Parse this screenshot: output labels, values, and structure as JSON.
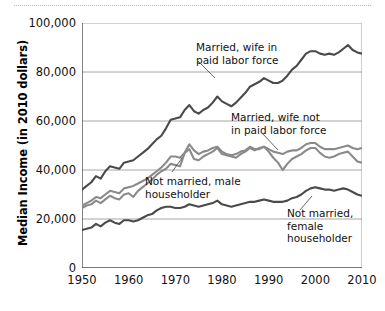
{
  "chart_data": {
    "type": "line",
    "title": "",
    "xlabel": "",
    "ylabel": "Median Income (in 2010 dollars)",
    "xlim": [
      1950,
      2010
    ],
    "ylim": [
      0,
      100000
    ],
    "grid": true,
    "legend_position": "inline-annotations",
    "ytick_labels": [
      "100,000",
      "80,000",
      "60,000",
      "40,000",
      "20,000",
      "0"
    ],
    "ytick_values": [
      100000,
      80000,
      60000,
      40000,
      20000,
      0
    ],
    "xtick_labels": [
      "1950",
      "1960",
      "1970",
      "1980",
      "1990",
      "2000",
      "2010"
    ],
    "xtick_values": [
      1950,
      1960,
      1970,
      1980,
      1990,
      2000,
      2010
    ],
    "x": [
      1950,
      1951,
      1952,
      1953,
      1954,
      1955,
      1956,
      1957,
      1958,
      1959,
      1960,
      1961,
      1962,
      1963,
      1964,
      1965,
      1966,
      1967,
      1968,
      1969,
      1970,
      1971,
      1972,
      1973,
      1974,
      1975,
      1976,
      1977,
      1978,
      1979,
      1980,
      1981,
      1982,
      1983,
      1984,
      1985,
      1986,
      1987,
      1988,
      1989,
      1990,
      1991,
      1992,
      1993,
      1994,
      1995,
      1996,
      1997,
      1998,
      1999,
      2000,
      2001,
      2002,
      2003,
      2004,
      2005,
      2006,
      2007,
      2008,
      2009,
      2010
    ],
    "series": [
      {
        "name": "Married, wife in paid labor force",
        "color": "#4a4a4a",
        "annotation": "Married, wife in\npaid labor force",
        "values": [
          32000,
          33500,
          35000,
          37500,
          36500,
          39500,
          41500,
          41000,
          40500,
          43000,
          43500,
          44000,
          45500,
          47000,
          48500,
          50500,
          52500,
          54000,
          57000,
          60500,
          61000,
          61500,
          64500,
          66500,
          64000,
          63000,
          64500,
          65500,
          67500,
          70000,
          68000,
          67000,
          66000,
          67500,
          69500,
          71500,
          74000,
          75000,
          76000,
          77500,
          76500,
          75500,
          75500,
          76500,
          78500,
          81000,
          82500,
          85000,
          87500,
          88500,
          88500,
          87500,
          87000,
          87500,
          87000,
          88000,
          89500,
          91000,
          89000,
          88000,
          87500
        ]
      },
      {
        "name": "Married, wife not in paid labor force",
        "color": "#8a8a8a",
        "annotation": "Married, wife not\nin paid labor force",
        "values": [
          25500,
          26500,
          27500,
          29000,
          28500,
          30000,
          31500,
          31000,
          30500,
          32500,
          33000,
          33500,
          34500,
          35500,
          36500,
          38000,
          39500,
          41000,
          43000,
          45500,
          45500,
          45000,
          47000,
          50500,
          48000,
          46500,
          47500,
          48000,
          49000,
          49500,
          47500,
          46500,
          46000,
          46500,
          47500,
          48000,
          49500,
          48500,
          48500,
          49500,
          48500,
          47500,
          47000,
          46500,
          47500,
          48000,
          48000,
          49000,
          50500,
          51000,
          51000,
          49500,
          48500,
          48500,
          48500,
          49000,
          49500,
          50000,
          49000,
          48500,
          49000
        ]
      },
      {
        "name": "Not married, male householder",
        "color": "#8a8a8a",
        "annotation": "Not married, male\nhouseholder",
        "values": [
          24500,
          25500,
          26000,
          27500,
          26500,
          28000,
          29500,
          28500,
          28000,
          30000,
          30500,
          29000,
          31500,
          33000,
          34500,
          36000,
          38000,
          39500,
          40500,
          42500,
          42000,
          41500,
          47000,
          48500,
          44500,
          44000,
          45500,
          46500,
          47500,
          49000,
          46500,
          46000,
          45500,
          45000,
          46500,
          47500,
          49000,
          48000,
          49000,
          49500,
          47500,
          45000,
          43000,
          40000,
          42500,
          44500,
          45500,
          46500,
          48000,
          49000,
          49000,
          47000,
          45500,
          45000,
          45500,
          46500,
          47000,
          47500,
          45500,
          43500,
          43000
        ]
      },
      {
        "name": "Not married, female householder",
        "color": "#4a4a4a",
        "annotation": "Not married,\nfemale\nhouseholder",
        "values": [
          15500,
          16000,
          16500,
          18000,
          17000,
          18500,
          19500,
          18500,
          18000,
          19500,
          19500,
          19000,
          19500,
          20500,
          21500,
          22000,
          23500,
          24500,
          25000,
          25000,
          24500,
          24500,
          25000,
          26000,
          25500,
          25000,
          25500,
          26000,
          26500,
          27500,
          26000,
          25500,
          25000,
          25500,
          26000,
          26500,
          27000,
          27000,
          27500,
          28000,
          27500,
          27000,
          27000,
          27000,
          27500,
          28500,
          29000,
          30000,
          31500,
          32500,
          33000,
          32500,
          32000,
          32000,
          31500,
          32000,
          32500,
          32000,
          31000,
          30000,
          29500
        ]
      }
    ]
  }
}
